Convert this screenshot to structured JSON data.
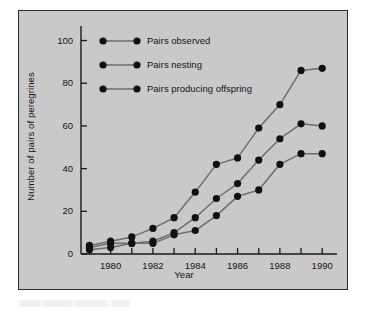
{
  "figure": {
    "background_color": "#c9c9c9",
    "frame_color": "#2a2a2a",
    "page_background": "#ffffff"
  },
  "chart_data": {
    "type": "line",
    "title": "",
    "subtitle": "",
    "xlabel": "Year",
    "ylabel": "Number of pairs of peregrines",
    "xlim": [
      1978.6,
      1990.7
    ],
    "ylim": [
      0,
      104
    ],
    "yticks": [
      0,
      20,
      40,
      60,
      80,
      100
    ],
    "ytick_labels": [
      "0",
      "20",
      "40",
      "60",
      "80",
      "100"
    ],
    "xticks": [
      1979,
      1980,
      1981,
      1982,
      1983,
      1984,
      1985,
      1986,
      1987,
      1988,
      1989,
      1990
    ],
    "xtick_labels": [
      "",
      "1980",
      "",
      "1982",
      "",
      "1984",
      "",
      "1986",
      "",
      "1988",
      "",
      "1990"
    ],
    "xtick_labels_shown": [
      "1980",
      "1982",
      "1984",
      "1986",
      "1988",
      "1990"
    ],
    "grid": false,
    "legend_position": "top-left-inside",
    "marker": "filled-circle",
    "marker_color": "#111111",
    "line_color": "#6e6e6e",
    "x": [
      1979,
      1980,
      1981,
      1982,
      1983,
      1984,
      1985,
      1986,
      1987,
      1988,
      1989,
      1990
    ],
    "series": [
      {
        "name": "Pairs observed",
        "values": [
          4,
          6,
          8,
          12,
          17,
          29,
          42,
          45,
          59,
          70,
          86,
          87
        ]
      },
      {
        "name": "Pairs nesting",
        "values": [
          3,
          5,
          5,
          6,
          10,
          17,
          26,
          33,
          44,
          54,
          61,
          60
        ]
      },
      {
        "name": "Pairs producing offspring",
        "values": [
          2,
          3,
          5,
          5,
          9,
          11,
          18,
          27,
          30,
          42,
          47,
          47
        ]
      }
    ]
  },
  "legend": {
    "entries": [
      {
        "label": "Pairs observed"
      },
      {
        "label": "Pairs nesting"
      },
      {
        "label": "Pairs producing offspring"
      }
    ]
  }
}
